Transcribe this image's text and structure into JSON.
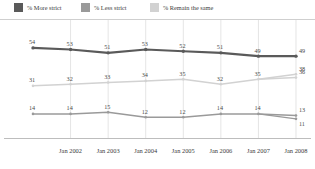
{
  "legend": {
    "items": [
      {
        "label": "% More strict",
        "color": "#5a5a5a",
        "name": "more-strict"
      },
      {
        "label": "% Less strict",
        "color": "#9a9a9a",
        "name": "less-strict"
      },
      {
        "label": "% Remain the same",
        "color": "#d2d2d2",
        "name": "remain-the-same"
      }
    ]
  },
  "chart_data": {
    "type": "line",
    "title": "",
    "xlabel": "",
    "ylabel": "",
    "grid": true,
    "legend_position": "top",
    "ylim": [
      0,
      60
    ],
    "x": [
      "",
      "Jan 2002",
      "Jan 2003",
      "Jan 2004",
      "Jan 2005",
      "Jan 2006",
      "Jan 2007",
      "Jan 2008"
    ],
    "tick_labels": [
      "Jan 2002",
      "Jan 2003",
      "Jan 2004",
      "Jan 2005",
      "Jan 2006",
      "Jan 2007",
      "Jan 2008"
    ],
    "series": [
      {
        "name": "% More strict",
        "color": "#5a5a5a",
        "values": [
          54,
          53,
          51,
          53,
          52,
          51,
          49,
          49
        ],
        "labels": [
          "54",
          "53",
          "51",
          "53",
          "52",
          "51",
          "49",
          "49"
        ],
        "endpoint_extra": null
      },
      {
        "name": "% Remain the same",
        "color": "#d2d2d2",
        "values": [
          31,
          32,
          33,
          34,
          35,
          32,
          35,
          36
        ],
        "labels": [
          "31",
          "32",
          "33",
          "34",
          "35",
          "32",
          "35",
          "36"
        ],
        "endpoint_extra": "38"
      },
      {
        "name": "% Less strict",
        "color": "#9a9a9a",
        "values": [
          14,
          14,
          15,
          12,
          12,
          14,
          14,
          13
        ],
        "labels": [
          "14",
          "14",
          "15",
          "12",
          "12",
          "14",
          "14",
          "13"
        ],
        "endpoint_extra": "11"
      }
    ]
  }
}
